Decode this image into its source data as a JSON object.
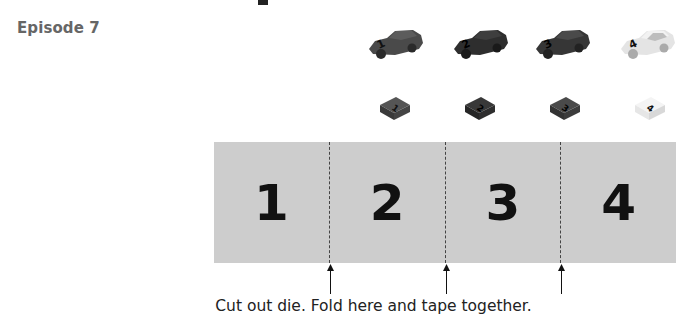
{
  "header": {
    "episode_label": "Episode 7"
  },
  "cars": [
    {
      "number": "1",
      "body_color": "#4a4a4a",
      "roof_color": "#5c5c5c"
    },
    {
      "number": "2",
      "body_color": "#2e2e2e",
      "roof_color": "#3e3e3e"
    },
    {
      "number": "3",
      "body_color": "#363636",
      "roof_color": "#4a4a4a"
    },
    {
      "number": "4",
      "body_color": "#e4e4e4",
      "roof_color": "#f2f2f2"
    }
  ],
  "tokens": [
    {
      "number": "1",
      "top_color": "#555555",
      "side_color": "#3a3a3a"
    },
    {
      "number": "2",
      "top_color": "#383838",
      "side_color": "#262626"
    },
    {
      "number": "3",
      "top_color": "#4a4a4a",
      "side_color": "#333333"
    },
    {
      "number": "4",
      "top_color": "#f4f4f4",
      "side_color": "#d8d8d8"
    }
  ],
  "die_strip": {
    "panels": [
      "1",
      "2",
      "3",
      "4"
    ],
    "background": "#cdcdcd"
  },
  "instructions": {
    "caption": "Cut out die. Fold here and tape together."
  }
}
